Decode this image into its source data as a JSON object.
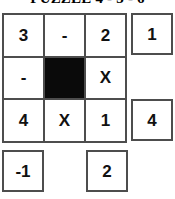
{
  "title": "PUZZLE 4 - 3 - 6",
  "grid": {
    "rows": 3,
    "cols": 3,
    "cells": [
      [
        {
          "value": "3",
          "blocked": false
        },
        {
          "value": "-",
          "blocked": false
        },
        {
          "value": "2",
          "blocked": false
        }
      ],
      [
        {
          "value": "-",
          "blocked": false
        },
        {
          "value": "",
          "blocked": true
        },
        {
          "value": "X",
          "blocked": false
        }
      ],
      [
        {
          "value": "4",
          "blocked": false
        },
        {
          "value": "X",
          "blocked": false
        },
        {
          "value": "1",
          "blocked": false
        }
      ]
    ]
  },
  "answers": {
    "right": [
      {
        "value": "1",
        "present": true
      },
      {
        "value": "",
        "present": false
      },
      {
        "value": "4",
        "present": true
      }
    ],
    "bottom": [
      {
        "value": "-1",
        "present": true
      },
      {
        "value": "",
        "present": false
      },
      {
        "value": "2",
        "present": true
      }
    ]
  },
  "colors": {
    "border": "#4d4d4d",
    "blocked_cell": "#0a0a0a",
    "text": "#111111",
    "background": "#ffffff"
  }
}
